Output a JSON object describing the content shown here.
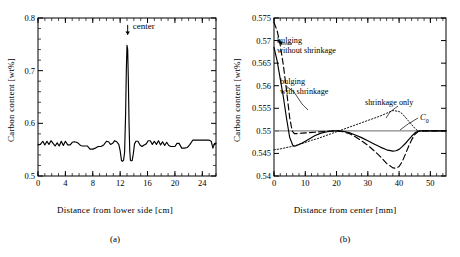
{
  "figure": {
    "panels": [
      {
        "id": "a",
        "caption": "(a)",
        "xlabel": "Distance from lower side [cm]",
        "ylabel": "Carbon content [wt%]",
        "annotation": "center"
      },
      {
        "id": "b",
        "caption": "(b)",
        "xlabel": "Distance from center [mm]",
        "ylabel": "Carbon content [wt%]",
        "labels": {
          "bulging_without": "bulging\nwithout shrinkage",
          "bulging_without_line1": "bulging",
          "bulging_without_line2": "without shrinkage",
          "bulging_with_line1": "bulging",
          "bulging_with_line2": "with shrinkage",
          "shrinkage_only": "shrinkage only",
          "c0": "C",
          "c0_sub": "0"
        }
      }
    ]
  },
  "chart_data": [
    {
      "type": "line",
      "panel": "a",
      "title": "",
      "xlabel": "Distance from lower side [cm]",
      "ylabel": "Carbon content [wt%]",
      "xlim": [
        0,
        26
      ],
      "ylim": [
        0.5,
        0.8
      ],
      "xticks": [
        0,
        4,
        8,
        12,
        16,
        20,
        24
      ],
      "xtick_labels": [
        "0",
        "4",
        "8",
        "12",
        "16",
        "20",
        "24"
      ],
      "yticks": [
        0.5,
        0.6,
        0.7,
        0.8
      ],
      "ytick_labels": [
        "0.5",
        "0.6",
        "0.7",
        "0.8"
      ],
      "minor_xtick_step": 1,
      "grid": false,
      "legend": "none",
      "annotations": [
        {
          "text": "center",
          "x": 13.1,
          "y": 0.785,
          "arrow": "down",
          "arrow_to_y": 0.768
        }
      ],
      "series": [
        {
          "name": "measured carbon content",
          "style": "solid",
          "x": [
            0.0,
            0.35,
            0.7,
            1.0,
            1.3,
            1.6,
            1.9,
            2.2,
            2.5,
            2.8,
            3.1,
            3.4,
            3.7,
            4.0,
            4.35,
            4.7,
            5.0,
            5.3,
            5.6,
            5.9,
            6.2,
            6.5,
            6.8,
            7.2,
            7.6,
            8.0,
            8.4,
            8.8,
            9.2,
            9.6,
            10.0,
            10.3,
            10.6,
            10.9,
            11.2,
            11.5,
            11.8,
            12.0,
            12.2,
            12.35,
            12.5,
            12.65,
            12.8,
            12.9,
            13.0,
            13.1,
            13.2,
            13.3,
            13.4,
            13.5,
            13.6,
            13.75,
            13.9,
            14.1,
            14.3,
            14.6,
            14.9,
            15.2,
            15.5,
            15.8,
            16.1,
            16.4,
            16.7,
            17.0,
            17.3,
            17.6,
            17.9,
            18.2,
            18.5,
            18.8,
            19.1,
            19.4,
            19.7,
            20.0,
            20.3,
            20.6,
            21.0,
            21.4,
            21.8,
            22.2,
            22.6,
            23.0,
            23.5,
            24.0,
            24.5,
            25.0,
            25.3,
            25.55,
            25.8,
            26.0
          ],
          "y": [
            0.559,
            0.56,
            0.566,
            0.559,
            0.566,
            0.56,
            0.567,
            0.562,
            0.557,
            0.563,
            0.557,
            0.566,
            0.558,
            0.566,
            0.559,
            0.559,
            0.564,
            0.565,
            0.564,
            0.562,
            0.558,
            0.557,
            0.557,
            0.557,
            0.551,
            0.551,
            0.553,
            0.556,
            0.556,
            0.559,
            0.566,
            0.565,
            0.56,
            0.562,
            0.567,
            0.565,
            0.56,
            0.548,
            0.529,
            0.528,
            0.53,
            0.545,
            0.62,
            0.7,
            0.748,
            0.74,
            0.68,
            0.6,
            0.548,
            0.53,
            0.529,
            0.529,
            0.54,
            0.561,
            0.566,
            0.566,
            0.559,
            0.556,
            0.559,
            0.561,
            0.567,
            0.567,
            0.56,
            0.566,
            0.56,
            0.567,
            0.559,
            0.565,
            0.558,
            0.564,
            0.558,
            0.556,
            0.556,
            0.556,
            0.562,
            0.562,
            0.553,
            0.553,
            0.554,
            0.56,
            0.568,
            0.568,
            0.568,
            0.568,
            0.568,
            0.568,
            0.566,
            0.553,
            0.562,
            0.562
          ]
        }
      ]
    },
    {
      "type": "line",
      "panel": "b",
      "title": "",
      "xlabel": "Distance from center [mm]",
      "ylabel": "Carbon content [wt%]",
      "xlim": [
        0,
        55
      ],
      "ylim": [
        0.54,
        0.575
      ],
      "xticks": [
        0,
        10,
        20,
        30,
        40,
        50
      ],
      "xtick_labels": [
        "0",
        "10",
        "20",
        "30",
        "40",
        "50"
      ],
      "yticks": [
        0.54,
        0.545,
        0.55,
        0.555,
        0.56,
        0.565,
        0.57,
        0.575
      ],
      "ytick_labels": [
        "0.54",
        "0.545",
        "0.55",
        "0.555",
        "0.56",
        "0.565",
        "0.57",
        "0.575"
      ],
      "minor_xtick_step": 2,
      "grid": false,
      "legend": "inline-annotations",
      "reference_line": {
        "name": "C0",
        "value": 0.55,
        "style": "solid-gray"
      },
      "series": [
        {
          "name": "bulging with shrinkage",
          "style": "solid",
          "x": [
            0,
            1,
            2,
            3,
            4,
            5,
            6,
            6.6,
            7.5,
            9,
            11,
            13,
            15,
            17,
            19,
            20.5,
            22,
            24,
            26,
            28,
            30,
            32,
            34,
            36,
            38,
            39,
            40,
            41,
            42,
            43,
            44,
            45,
            46,
            46.8,
            48,
            50,
            52,
            55
          ],
          "y": [
            0.5685,
            0.5655,
            0.5615,
            0.5575,
            0.5528,
            0.5486,
            0.5468,
            0.5466,
            0.5468,
            0.5473,
            0.5481,
            0.5489,
            0.5495,
            0.5498,
            0.55,
            0.55,
            0.5499,
            0.5496,
            0.5491,
            0.5485,
            0.5478,
            0.5471,
            0.5464,
            0.5458,
            0.5455,
            0.5456,
            0.5459,
            0.5465,
            0.5472,
            0.548,
            0.5488,
            0.5495,
            0.5499,
            0.55,
            0.55,
            0.55,
            0.55,
            0.55
          ]
        },
        {
          "name": "bulging without shrinkage",
          "style": "dashed",
          "x": [
            0,
            1,
            2,
            3,
            4,
            5,
            5.8,
            6.5,
            7.5,
            9,
            11,
            13,
            15,
            17,
            19,
            20.5,
            22,
            24,
            26,
            28,
            30,
            32,
            34,
            36,
            38,
            39,
            40,
            41,
            42,
            43,
            44,
            45,
            46,
            46.8,
            48,
            50,
            52,
            55
          ],
          "y": [
            0.574,
            0.5722,
            0.569,
            0.5645,
            0.559,
            0.553,
            0.55,
            0.5494,
            0.5494,
            0.5495,
            0.5496,
            0.5497,
            0.5498,
            0.5499,
            0.55,
            0.55,
            0.5498,
            0.5494,
            0.5487,
            0.5478,
            0.5468,
            0.5456,
            0.5443,
            0.5428,
            0.5418,
            0.5417,
            0.5421,
            0.5432,
            0.5448,
            0.5465,
            0.548,
            0.5492,
            0.5498,
            0.55,
            0.55,
            0.55,
            0.55,
            0.55
          ]
        },
        {
          "name": "shrinkage only",
          "style": "dotted",
          "x": [
            0,
            2,
            4,
            6,
            8,
            10,
            12,
            14,
            16,
            18,
            20,
            22,
            24,
            26,
            28,
            30,
            32,
            34,
            36,
            38,
            40,
            41,
            42,
            43,
            44,
            45,
            46,
            46.8,
            48,
            50,
            52,
            55
          ],
          "y": [
            0.5458,
            0.546,
            0.5463,
            0.5466,
            0.547,
            0.5474,
            0.5479,
            0.5483,
            0.5488,
            0.5493,
            0.5498,
            0.5503,
            0.5508,
            0.5513,
            0.5518,
            0.5523,
            0.5528,
            0.5533,
            0.5539,
            0.5545,
            0.5543,
            0.5538,
            0.553,
            0.5522,
            0.5514,
            0.5506,
            0.55,
            0.55,
            0.55,
            0.55,
            0.55,
            0.55
          ]
        }
      ],
      "annotations": [
        {
          "text": "bulging without shrinkage",
          "x": 8,
          "y": 0.5695,
          "points_to_series": "bulging without shrinkage"
        },
        {
          "text": "bulging with shrinkage",
          "x": 9,
          "y": 0.5595,
          "points_to_series": "bulging with shrinkage"
        },
        {
          "text": "shrinkage only",
          "x": 33,
          "y": 0.5565,
          "points_to_series": "shrinkage only"
        },
        {
          "text": "C0",
          "x": 47,
          "y": 0.5545,
          "points_to_series": "reference"
        }
      ]
    }
  ]
}
